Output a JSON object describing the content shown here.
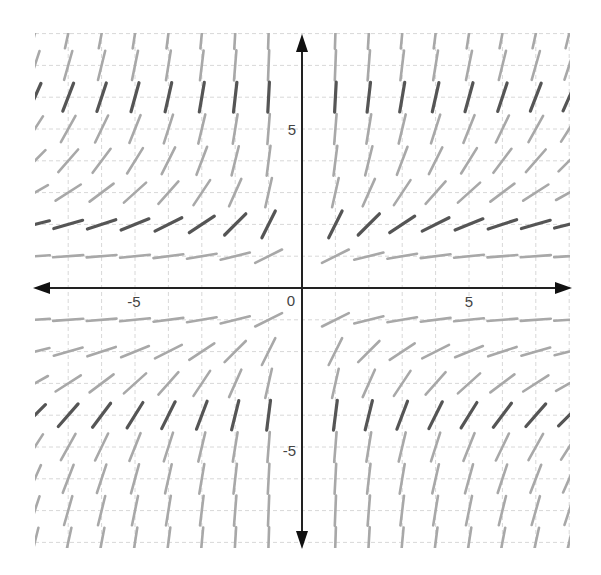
{
  "chart_data": {
    "type": "slope_field",
    "title": "",
    "xlabel": "",
    "ylabel": "",
    "xlim": [
      -8,
      8
    ],
    "ylim": [
      -8,
      8
    ],
    "grid": true,
    "grid_step": 1,
    "tick_labels": {
      "x": [
        {
          "value": -5,
          "label": "-5"
        },
        {
          "value": 5,
          "label": "5"
        }
      ],
      "y": [
        {
          "value": 5,
          "label": "5"
        },
        {
          "value": -5,
          "label": "-5"
        }
      ],
      "origin": "0"
    },
    "slope_function_approx": "dy/dx ≈ y² / (2|x|)",
    "sample_points_x": [
      -8,
      -7,
      -6,
      -5,
      -4,
      -3,
      -2,
      -1,
      1,
      2,
      3,
      4,
      5,
      6,
      7,
      8
    ],
    "sample_points_y": [
      8,
      7,
      6,
      5,
      4,
      3,
      2,
      1,
      -1,
      -2,
      -3,
      -4,
      -5,
      -6,
      -7,
      -8
    ],
    "dark_rows_y": [
      6,
      2,
      -4
    ],
    "colors": {
      "segment_light": "#a8a8a8",
      "segment_dark": "#555555",
      "grid": "#d8d8d8",
      "axis": "#222222"
    }
  },
  "labels": {
    "x_neg5": "-5",
    "x_pos5": "5",
    "y_pos5": "5",
    "y_neg5": "-5",
    "origin": "0"
  }
}
